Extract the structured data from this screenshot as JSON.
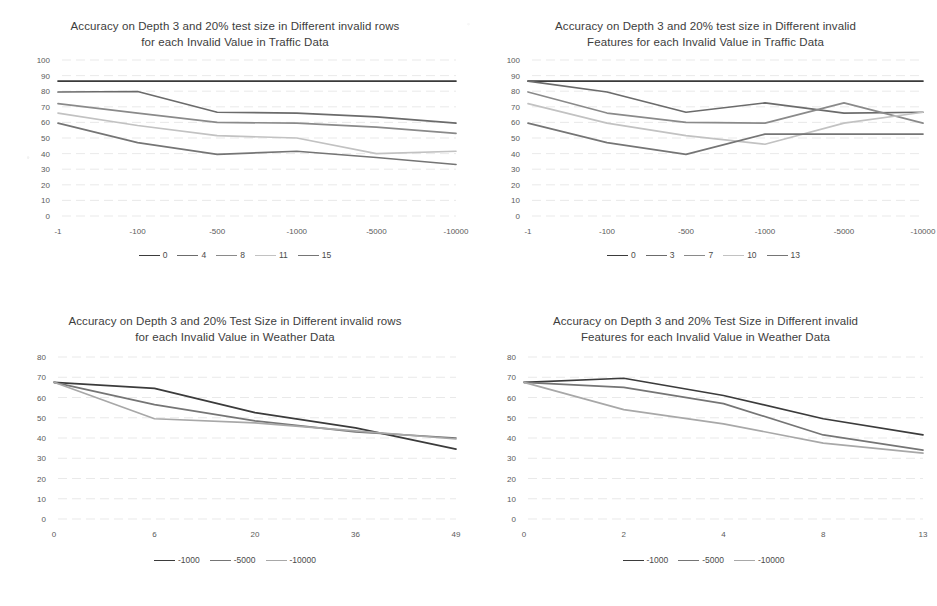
{
  "page": {
    "background": "#ffffff",
    "palette": {
      "series1": "#3b3b3b",
      "series2": "#6b6b6b",
      "series3": "#8a8a8a",
      "series4": "#c2c2c2",
      "series5": "#757575",
      "gridline": "#e3e3e3",
      "axis_text": "#5a5a5a",
      "title_text": "#3d3d3d"
    }
  },
  "charts": [
    {
      "id": "traffic-invalid-rows",
      "position": "top-left",
      "chart_data": {
        "type": "line",
        "title": "Accuracy on Depth 3 and 20% test size in Different invalid rows for each Invalid Value in Traffic Data",
        "title_line1": "Accuracy on Depth 3 and 20% test size in Different invalid rows",
        "title_line2": "for each Invalid Value in Traffic Data",
        "xlabel": "",
        "ylabel": "",
        "categories": [
          "-1",
          "-100",
          "-500",
          "-1000",
          "-5000",
          "-10000"
        ],
        "ylim": [
          0,
          100
        ],
        "yticks": [
          0,
          10,
          20,
          30,
          40,
          50,
          60,
          70,
          80,
          90,
          100
        ],
        "grid": true,
        "legend_position": "bottom",
        "series": [
          {
            "name": "0",
            "color": "#3b3b3b",
            "values": [
              86.5,
              86.5,
              86.5,
              86.5,
              86.5,
              86.5
            ]
          },
          {
            "name": "4",
            "color": "#6b6b6b",
            "values": [
              79.5,
              79.8,
              66.5,
              66.0,
              63.5,
              59.5
            ]
          },
          {
            "name": "8",
            "color": "#8a8a8a",
            "values": [
              72.0,
              66.0,
              60.0,
              59.5,
              57.0,
              53.0
            ]
          },
          {
            "name": "11",
            "color": "#c2c2c2",
            "values": [
              66.0,
              58.0,
              51.5,
              50.0,
              40.0,
              41.5
            ]
          },
          {
            "name": "15",
            "color": "#757575",
            "values": [
              59.5,
              47.0,
              39.5,
              41.5,
              37.5,
              33.0
            ]
          }
        ]
      }
    },
    {
      "id": "traffic-invalid-features",
      "position": "top-right",
      "chart_data": {
        "type": "line",
        "title": "Accuracy on Depth 3 and 20% test size in Different invalid Features for each Invalid Value in Traffic Data",
        "title_line1": "Accuracy on Depth 3 and 20% test size in Different invalid",
        "title_line2": "Features for each Invalid Value in Traffic Data",
        "xlabel": "",
        "ylabel": "",
        "categories": [
          "-1",
          "-100",
          "-500",
          "-1000",
          "-5000",
          "-10000"
        ],
        "ylim": [
          0,
          100
        ],
        "yticks": [
          0,
          10,
          20,
          30,
          40,
          50,
          60,
          70,
          80,
          90,
          100
        ],
        "grid": true,
        "legend_position": "bottom",
        "series": [
          {
            "name": "0",
            "color": "#3b3b3b",
            "values": [
              86.5,
              86.5,
              86.5,
              86.5,
              86.5,
              86.5
            ]
          },
          {
            "name": "3",
            "color": "#6b6b6b",
            "values": [
              86.5,
              79.5,
              66.5,
              72.5,
              66.0,
              66.5
            ]
          },
          {
            "name": "7",
            "color": "#8a8a8a",
            "values": [
              79.5,
              66.0,
              60.0,
              59.5,
              72.5,
              59.5
            ]
          },
          {
            "name": "10",
            "color": "#c2c2c2",
            "values": [
              72.0,
              59.5,
              51.5,
              46.0,
              59.5,
              66.5
            ]
          },
          {
            "name": "13",
            "color": "#757575",
            "values": [
              59.5,
              47.0,
              39.5,
              52.5,
              52.5,
              52.5
            ]
          }
        ]
      }
    },
    {
      "id": "weather-invalid-rows",
      "position": "bottom-left",
      "chart_data": {
        "type": "line",
        "title": "Accuracy on Depth 3 and 20% Test Size in Different invalid rows for each Invalid Value in Weather Data",
        "title_line1": "Accuracy on Depth 3 and 20% Test Size in Different invalid rows",
        "title_line2": "for each Invalid Value in Weather Data",
        "xlabel": "",
        "ylabel": "",
        "categories": [
          "0",
          "6",
          "20",
          "36",
          "49"
        ],
        "ylim": [
          0,
          80
        ],
        "yticks": [
          0,
          10,
          20,
          30,
          40,
          50,
          60,
          70,
          80
        ],
        "grid": true,
        "legend_position": "bottom",
        "series": [
          {
            "name": "-1000",
            "color": "#3b3b3b",
            "values": [
              67.5,
              64.5,
              52.5,
              45.0,
              34.5
            ]
          },
          {
            "name": "-5000",
            "color": "#757575",
            "values": [
              67.5,
              56.5,
              48.5,
              43.0,
              40.0
            ]
          },
          {
            "name": "-10000",
            "color": "#a8a8a8",
            "values": [
              67.5,
              49.5,
              47.5,
              43.5,
              39.5
            ]
          }
        ]
      }
    },
    {
      "id": "weather-invalid-features",
      "position": "bottom-right",
      "chart_data": {
        "type": "line",
        "title": "Accuracy on Depth 3 and 20% Test Size in Different invalid Features for each Invalid Value in Weather Data",
        "title_line1": "Accuracy on Depth 3 and 20% Test Size in Different invalid",
        "title_line2": "Features for each Invalid Value in Weather Data",
        "xlabel": "",
        "ylabel": "",
        "categories": [
          "0",
          "2",
          "4",
          "8",
          "13"
        ],
        "ylim": [
          0,
          80
        ],
        "yticks": [
          0,
          10,
          20,
          30,
          40,
          50,
          60,
          70,
          80
        ],
        "grid": true,
        "legend_position": "bottom",
        "series": [
          {
            "name": "-1000",
            "color": "#3b3b3b",
            "values": [
              67.5,
              69.5,
              61.0,
              49.5,
              41.5
            ]
          },
          {
            "name": "-5000",
            "color": "#757575",
            "values": [
              67.5,
              65.0,
              57.0,
              41.5,
              34.0
            ]
          },
          {
            "name": "-10000",
            "color": "#a8a8a8",
            "values": [
              67.5,
              54.0,
              47.0,
              37.5,
              32.5
            ]
          }
        ]
      }
    }
  ]
}
